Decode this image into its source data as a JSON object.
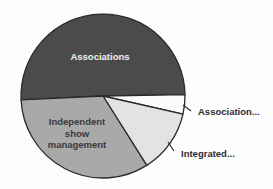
{
  "chart_data": {
    "type": "pie",
    "title": "",
    "start_angle_deg": 177.3,
    "direction": "clockwise",
    "center": [
      103,
      96
    ],
    "radius": 82,
    "slices": [
      {
        "label": "Associations",
        "value": 50.5,
        "color": "#4b4b4b",
        "label_position": "inside",
        "label_lines": [
          "Associations"
        ],
        "label_color_class": "lbl-inside-dark",
        "label_xy": [
          100,
          60
        ]
      },
      {
        "label": "Association...",
        "value": 3.8,
        "color": "#fbfbfb",
        "label_position": "outside",
        "label_lines": [
          "Association..."
        ],
        "label_color_class": "lbl-outside",
        "label_xy": [
          198,
          115
        ],
        "leader": [
          [
            183,
            105
          ],
          [
            191,
            111
          ]
        ]
      },
      {
        "label": "Integrated...",
        "value": 12.5,
        "color": "#e3e3e3",
        "label_position": "outside",
        "label_lines": [
          "Integrated..."
        ],
        "label_color_class": "lbl-outside",
        "label_xy": [
          181,
          157
        ],
        "leader": [
          [
            168,
            142
          ],
          [
            174,
            151
          ]
        ]
      },
      {
        "label": "Independent show management",
        "value": 33.2,
        "color": "#a9a9a9",
        "label_position": "inside",
        "label_lines": [
          "Independent",
          "show",
          "management"
        ],
        "label_color_class": "lbl-inside-light",
        "label_xy": [
          77,
          125
        ]
      }
    ],
    "legend": "none"
  }
}
